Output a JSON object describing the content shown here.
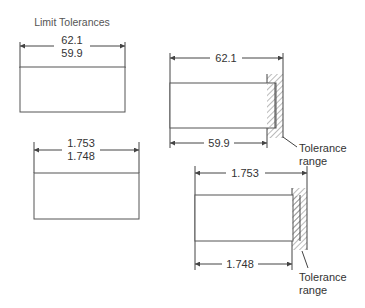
{
  "title": "Limit Tolerances",
  "examples": [
    {
      "name": "metric-limit",
      "upper_limit": "62.1",
      "lower_limit": "59.9"
    },
    {
      "name": "inch-limit",
      "upper_limit": "1.753",
      "lower_limit": "1.748"
    }
  ],
  "details": [
    {
      "name": "metric-detail",
      "max_dimension": "62.1",
      "min_dimension": "59.9",
      "callout_line1": "Tolerance",
      "callout_line2": "range"
    },
    {
      "name": "inch-detail",
      "max_dimension": "1.753",
      "min_dimension": "1.748",
      "callout_line1": "Tolerance",
      "callout_line2": "range"
    }
  ],
  "colors": {
    "line": "#444444",
    "text": "#333333",
    "hatch": "#777777"
  }
}
